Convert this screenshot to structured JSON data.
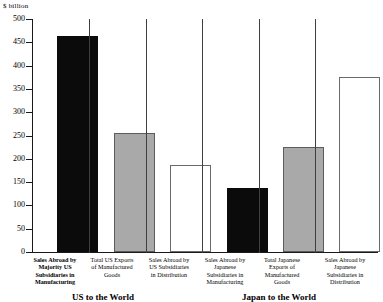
{
  "chart_data": {
    "type": "bar",
    "title": "",
    "subtitle": "",
    "unit_label": "$ billion",
    "xlabel": "",
    "ylabel": "$ billion",
    "ylim": [
      0,
      500
    ],
    "ytick_step": 50,
    "grid": false,
    "legend": "none",
    "ytick_labels": [
      "0",
      "50",
      "100",
      "150",
      "200",
      "250",
      "300",
      "350",
      "400",
      "450",
      "500"
    ],
    "ytick_values": [
      0,
      50,
      100,
      150,
      200,
      250,
      300,
      350,
      400,
      450,
      500
    ],
    "categories": [
      "Sales Abroad by Majority US Subsidiaries in Manufacturing",
      "Total US Exports of Manufactured Goods",
      "Sales Abroad by US Subsidiaries in Distribution",
      "Sales Abroad by Japanese Subsidiaries in Manufacturing",
      "Total Japanese Exports of Manufactured Goods",
      "Sales Abroad by Japanese Subsidiaries in Distribution"
    ],
    "values": [
      463,
      255,
      187,
      137,
      225,
      375
    ],
    "bar_styles": [
      "black",
      "gray",
      "white",
      "black",
      "gray",
      "white"
    ],
    "groups": [
      {
        "caption": "US to the World",
        "categories": [
          0,
          1,
          2
        ]
      },
      {
        "caption": "Japan to the World",
        "categories": [
          3,
          4,
          5
        ]
      }
    ],
    "colors": {
      "black": "#0b0b0b",
      "gray": "#a9a9a9",
      "white": "#ffffff",
      "axis": "#1a1a1a"
    }
  },
  "xtick_labels": [
    {
      "lines": [
        "Sales Abroad by",
        "Majority US",
        "Subsidiaries in",
        "Manufacturing"
      ],
      "bold": true
    },
    {
      "lines": [
        "Total US Exports",
        "of Manufactured",
        "Goods"
      ],
      "bold": false
    },
    {
      "lines": [
        "Sales Abroad by",
        "US Subsidiaries",
        "in Distribution"
      ],
      "bold": false
    },
    {
      "lines": [
        "Sales Abroad by",
        "Japanese",
        "Subsidiaries in",
        "Manufacturing"
      ],
      "bold": false
    },
    {
      "lines": [
        "Total Japanese",
        "Exports of",
        "Manufactured",
        "Goods"
      ],
      "bold": false
    },
    {
      "lines": [
        "Sales Abroad by",
        "Japanese",
        "Subsidiaries in",
        "Distribution"
      ],
      "bold": false
    }
  ],
  "group_captions": {
    "left": "US to the World",
    "right": "Japan to the World"
  }
}
